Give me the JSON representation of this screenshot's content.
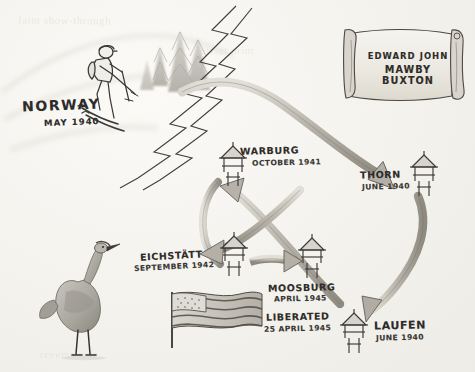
{
  "diagram": {
    "medium": "hand-drawn pencil sketch",
    "paper_color": "#f4f2ed",
    "ink_color": "#33312e"
  },
  "scroll": {
    "name_line_1": "EDWARD  JOHN",
    "name_line_2": "MAWBY  BUXTON"
  },
  "origin": {
    "place": "NORWAY",
    "date": "MAY 1940"
  },
  "stops": [
    {
      "id": "thorn",
      "place": "THORN",
      "date": "JUNE 1940",
      "icon": "guard-tower-icon"
    },
    {
      "id": "laufen",
      "place": "LAUFEN",
      "date": "JUNE 1940",
      "icon": "guard-tower-icon"
    },
    {
      "id": "warburg",
      "place": "WARBURG",
      "date": "OCTOBER 1941",
      "icon": "guard-tower-icon"
    },
    {
      "id": "eichstatt",
      "place": "EICHSTÄTT",
      "date": "SEPTEMBER 1942",
      "icon": "guard-tower-icon"
    },
    {
      "id": "moosburg",
      "place": "MOOSBURG",
      "date": "APRIL 1945",
      "icon": "guard-tower-icon"
    }
  ],
  "liberation": {
    "label": "LIBERATED",
    "date": "25 APRIL 1945",
    "icon": "american-flag-icon"
  },
  "illustrations": [
    {
      "id": "skier",
      "icon": "skier-icon",
      "caption": "skier with backpack and poles"
    },
    {
      "id": "trees",
      "icon": "pine-trees-icon",
      "caption": "pine trees"
    },
    {
      "id": "crane",
      "icon": "crane-bird-icon",
      "caption": "standing crane"
    },
    {
      "id": "zigzag-road",
      "icon": "zigzag-road-icon",
      "caption": "zigzag road band"
    }
  ],
  "arrows": [
    {
      "id": "norway-thorn",
      "from": "NORWAY",
      "to": "THORN"
    },
    {
      "id": "thorn-laufen",
      "from": "THORN",
      "to": "LAUFEN"
    },
    {
      "id": "laufen-warburg",
      "from": "LAUFEN",
      "to": "WARBURG"
    },
    {
      "id": "warburg-eichstatt",
      "from": "WARBURG",
      "to": "EICHSTÄTT"
    },
    {
      "id": "eichstatt-moosburg",
      "from": "EICHSTÄTT",
      "to": "MOOSBURG"
    }
  ],
  "ghost_text": {
    "a": "faint show-through",
    "b": "offset print",
    "c": "reverse side"
  }
}
